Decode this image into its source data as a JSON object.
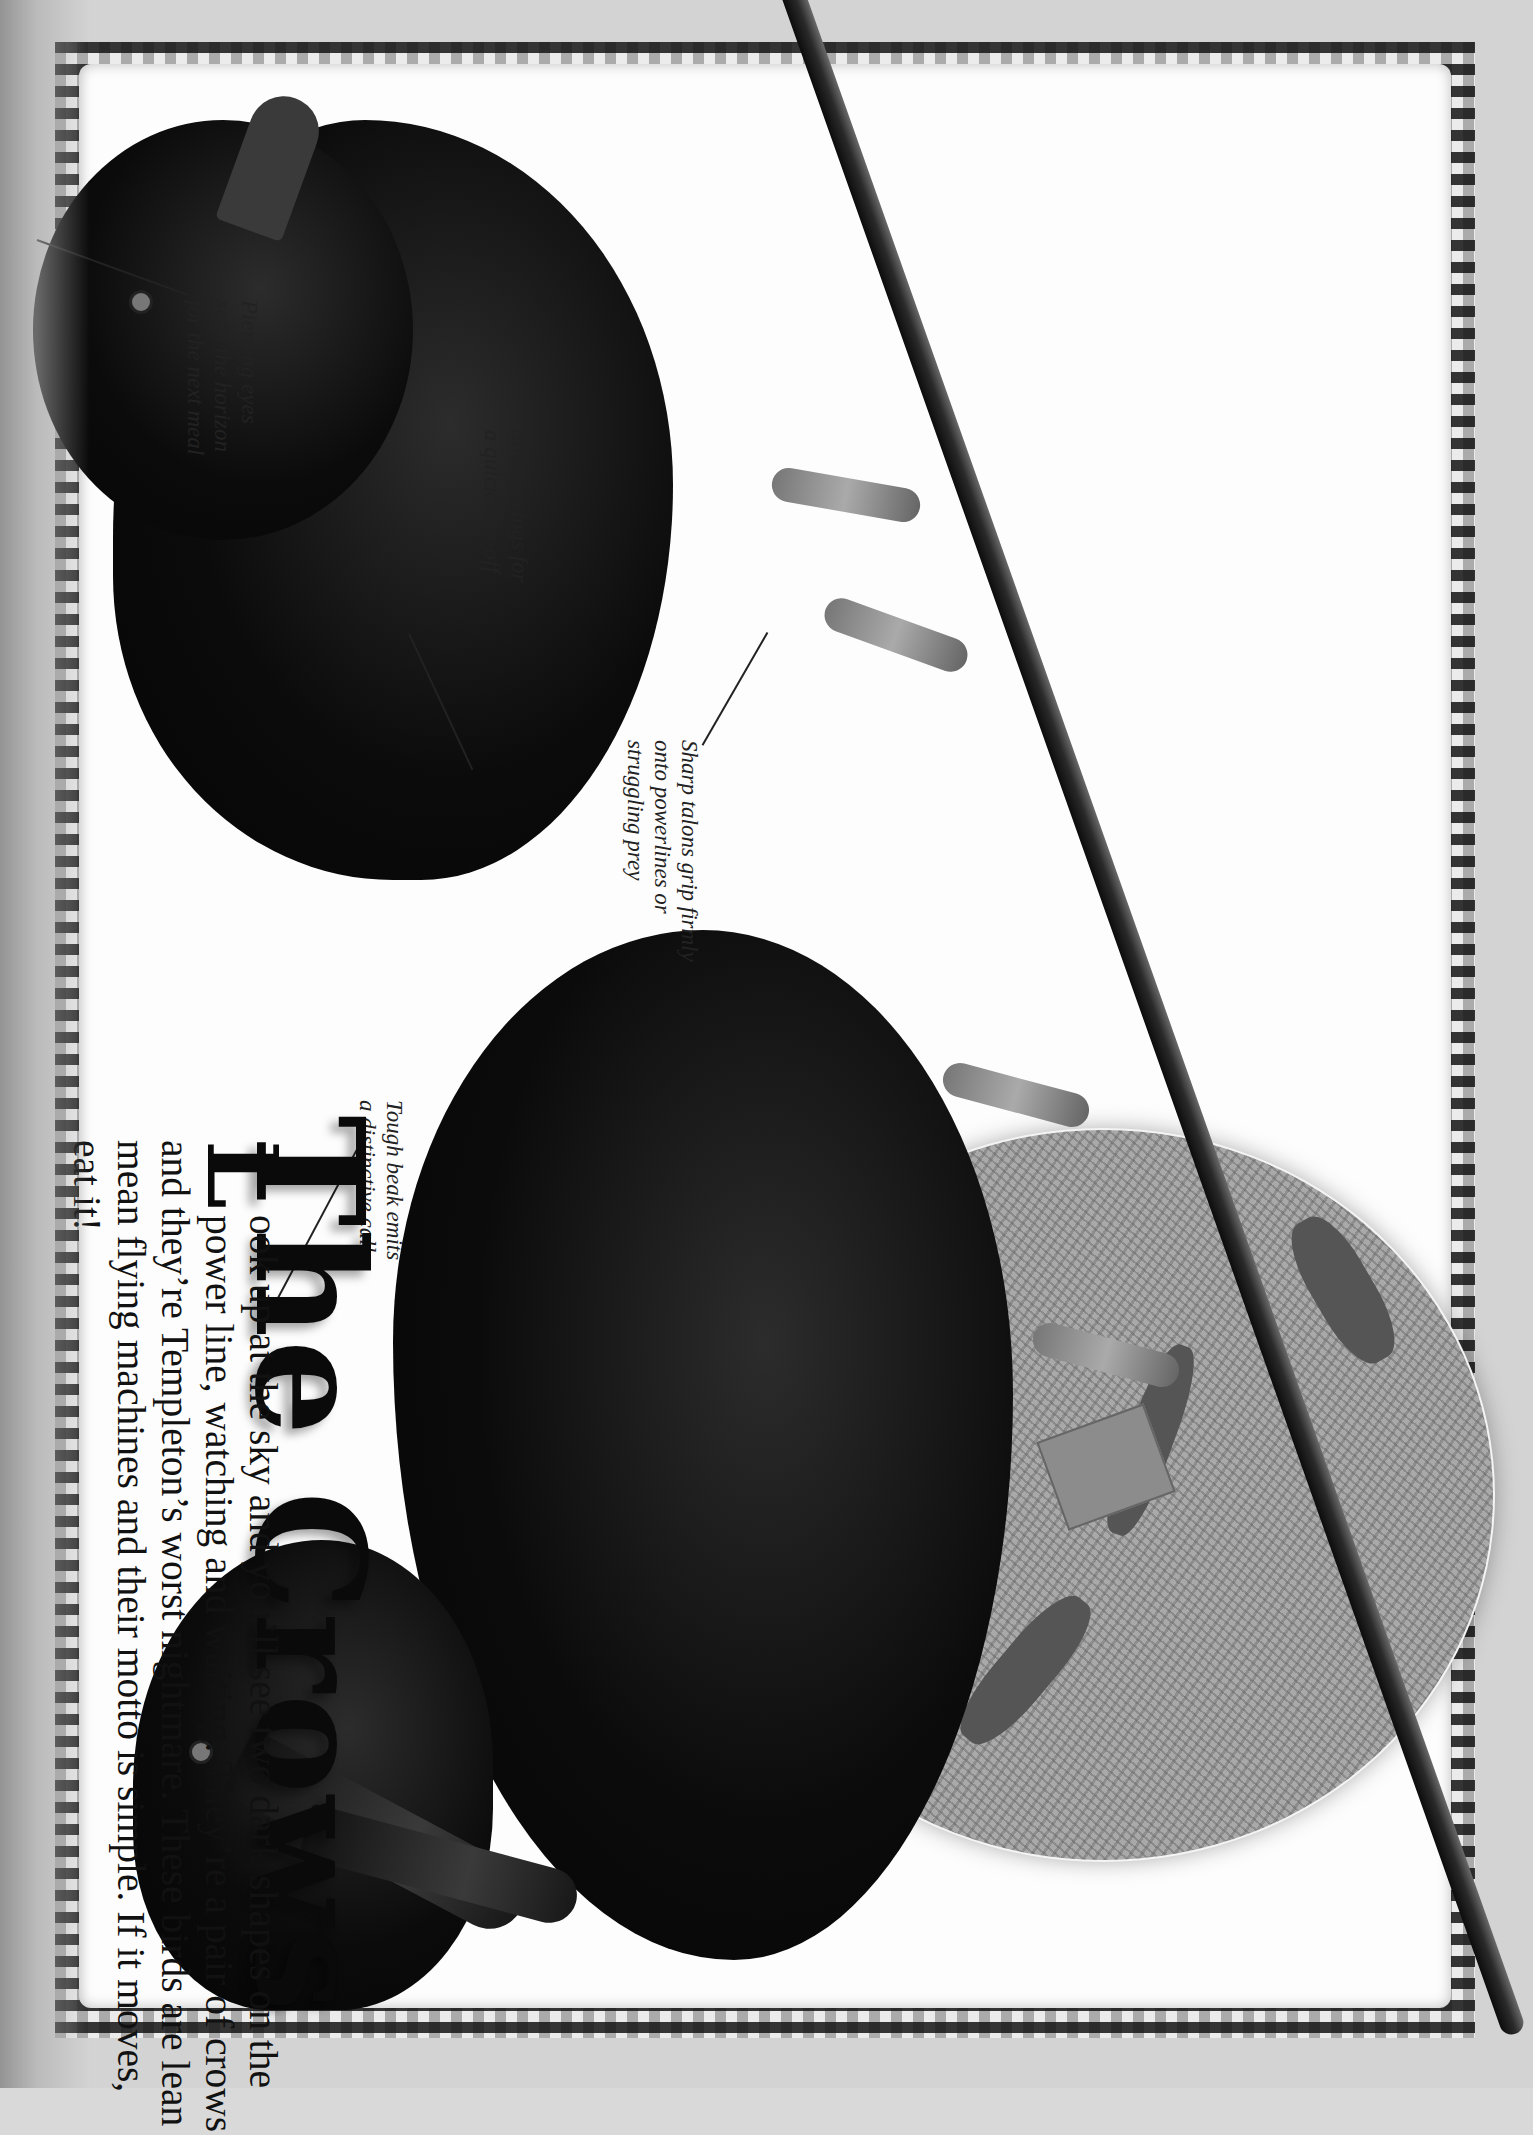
{
  "page": {
    "orientation": "rotated-90-clockwise",
    "title": "The Crows",
    "body": {
      "dropcap": "L",
      "text": "ook up at the sky and you’ll see two dark shapes on the power line, watching and waiting. They’re a pair of crows and they’re Templeton’s worst nightmare. These birds are lean mean flying machines and their motto is simple. If it moves, eat it!"
    },
    "annotations": [
      {
        "id": "eyes",
        "text": "Piercing eyes\nscan the horizon\nfor the next meal"
      },
      {
        "id": "wings",
        "text": "Strong wings for\na quick take-off"
      },
      {
        "id": "talons",
        "text": "Sharp talons grip firmly\nonto powerlines or\nstruggling prey"
      },
      {
        "id": "beak",
        "text": "Tough beak emits\na distinctive call"
      }
    ],
    "images": {
      "left_crow": "crow perched on power line, facing viewer",
      "right_crow": "crow perched on power line, beak open",
      "oval_photo": "rats running on grass near a trap"
    },
    "colors": {
      "paper": "#fdfdfd",
      "outer": "#d3d3d3",
      "ink": "#111111",
      "border_check": "#1a1a1a"
    }
  }
}
